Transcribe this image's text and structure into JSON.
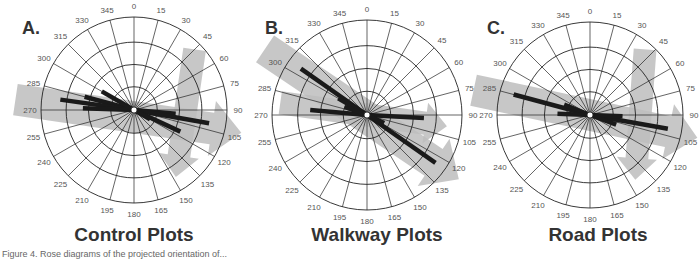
{
  "chart_data": [
    {
      "type": "rose",
      "panel_letter": "A.",
      "title": "Control Plots",
      "angular_ticks": [
        0,
        15,
        30,
        45,
        60,
        75,
        90,
        105,
        120,
        135,
        150,
        165,
        180,
        195,
        210,
        225,
        240,
        255,
        270,
        285,
        300,
        315,
        330,
        345
      ],
      "rings": 4,
      "geometry": {
        "cx": 134,
        "cy": 110,
        "r": 93
      },
      "bars": [
        {
          "angle": 285,
          "length": 0.55
        },
        {
          "angle": 278,
          "length": 0.8
        },
        {
          "angle": 272,
          "length": 0.55
        },
        {
          "angle": 300,
          "length": 0.4
        },
        {
          "angle": 95,
          "length": 0.45
        },
        {
          "angle": 100,
          "length": 0.82
        },
        {
          "angle": 115,
          "length": 0.55
        },
        {
          "angle": 120,
          "length": 0.2
        }
      ],
      "mean_arrow": {
        "from_angle": 275,
        "to_angle": 102,
        "color": "#bdbdbd"
      },
      "secondary_arrow": {
        "from_angle": 45,
        "to_angle": 148,
        "color": "#bdbdbd"
      }
    },
    {
      "type": "rose",
      "panel_letter": "B.",
      "title": "Walkway Plots",
      "angular_ticks": [
        0,
        15,
        30,
        45,
        60,
        75,
        90,
        105,
        120,
        135,
        150,
        165,
        180,
        195,
        210,
        225,
        240,
        255,
        270,
        285,
        300,
        315,
        330,
        345
      ],
      "rings": 4,
      "geometry": {
        "cx": 367,
        "cy": 115,
        "r": 95
      },
      "bars": [
        {
          "angle": 305,
          "length": 0.85
        },
        {
          "angle": 300,
          "length": 0.35
        },
        {
          "angle": 275,
          "length": 0.6
        },
        {
          "angle": 290,
          "length": 0.25
        },
        {
          "angle": 93,
          "length": 0.6
        },
        {
          "angle": 125,
          "length": 0.88
        },
        {
          "angle": 115,
          "length": 0.2
        }
      ],
      "mean_arrow": {
        "from_angle": 303,
        "to_angle": 125,
        "color": "#bdbdbd"
      },
      "secondary_arrow": {
        "from_angle": 278,
        "to_angle": 98,
        "color": "#bdbdbd"
      }
    },
    {
      "type": "rose",
      "panel_letter": "C.",
      "title": "Road Plots",
      "angular_ticks": [
        0,
        15,
        30,
        45,
        60,
        75,
        90,
        105,
        120,
        135,
        150,
        165,
        180,
        195,
        210,
        225,
        240,
        255,
        270,
        285,
        300,
        315,
        330,
        345
      ],
      "rings": 4,
      "geometry": {
        "cx": 590,
        "cy": 115,
        "r": 93
      },
      "bars": [
        {
          "angle": 285,
          "length": 0.85
        },
        {
          "angle": 292,
          "length": 0.3
        },
        {
          "angle": 272,
          "length": 0.35
        },
        {
          "angle": 100,
          "length": 0.85
        },
        {
          "angle": 92,
          "length": 0.35
        },
        {
          "angle": 110,
          "length": 0.3
        }
      ],
      "mean_arrow": {
        "from_angle": 282,
        "to_angle": 102,
        "color": "#bdbdbd"
      },
      "secondary_arrow": {
        "from_angle": 40,
        "to_angle": 145,
        "color": "#bdbdbd"
      }
    }
  ],
  "panels": [
    {
      "letter": "A.",
      "title": "Control Plots"
    },
    {
      "letter": "B.",
      "title": "Walkway Plots"
    },
    {
      "letter": "C.",
      "title": "Road Plots"
    }
  ],
  "caption": "Figure 4. Rose diagrams of the projected orientation of...",
  "colors": {
    "grid": "#222222",
    "bar": "#1a1a1a",
    "arrow": "#bdbdbd",
    "label": "#555555",
    "title": "#333333"
  }
}
